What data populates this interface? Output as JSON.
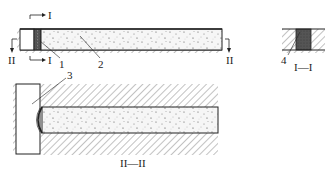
{
  "diagram": {
    "type": "engineering-section-drawing",
    "views": [
      {
        "id": "plan",
        "description": "Longitudinal view of rod with end plate and anchor"
      },
      {
        "id": "section-I-I",
        "title": "I—I"
      },
      {
        "id": "section-II-II",
        "title": "II—II"
      }
    ],
    "section_markers": {
      "I_top": "I",
      "I_bottom": "I",
      "II_left": "II",
      "II_right": "II"
    },
    "callouts": [
      {
        "number": "1",
        "target": "end plate"
      },
      {
        "number": "2",
        "target": "concrete/filled body"
      },
      {
        "number": "3",
        "target": "curved bearing surface"
      },
      {
        "number": "4",
        "target": "cross-section core"
      }
    ],
    "section_titles": {
      "section_1": "I—I",
      "section_2": "II—II"
    },
    "colors": {
      "line": "#222222",
      "hatch": "#555555",
      "fill_speckle": "#f4f4f4",
      "dark_core": "#4a4a4a"
    }
  }
}
